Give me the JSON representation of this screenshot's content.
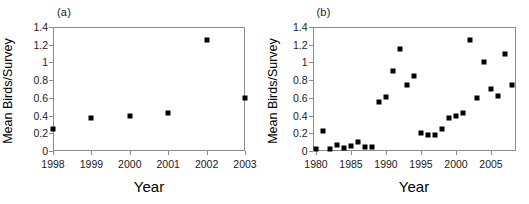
{
  "figure": {
    "panels": [
      {
        "letter": "(a)",
        "chart_data": {
          "type": "scatter",
          "title": "(a)",
          "xlabel": "Year",
          "ylabel": "Mean Birds/Survey",
          "xlim": [
            1998,
            2003
          ],
          "ylim": [
            0,
            1.4
          ],
          "xticks": [
            1998,
            1999,
            2000,
            2001,
            2002,
            2003
          ],
          "xtick_labels": [
            "1998",
            "1999",
            "2000",
            "2001",
            "2002",
            "2003"
          ],
          "yticks": [
            0,
            0.2,
            0.4,
            0.6,
            0.8,
            1,
            1.2,
            1.4
          ],
          "ytick_labels": [
            "0",
            "0.2",
            "0.4",
            "0.6",
            "0.8",
            "1",
            "1.2",
            "1.4"
          ],
          "grid": false,
          "legend": null,
          "marker": "filled-square",
          "marker_color": "#000000",
          "x": [
            1998,
            1999,
            2000,
            2001,
            2002,
            2003
          ],
          "y": [
            0.25,
            0.37,
            0.4,
            0.43,
            1.25,
            0.6
          ]
        }
      },
      {
        "letter": "(b)",
        "chart_data": {
          "type": "scatter",
          "title": "(b)",
          "xlabel": "Year",
          "ylabel": "Mean Birds/Survey",
          "xlim": [
            1979.5,
            2008.5
          ],
          "ylim": [
            0,
            1.4
          ],
          "xticks": [
            1980,
            1985,
            1990,
            1995,
            2000,
            2005
          ],
          "xtick_labels": [
            "1980",
            "1985",
            "1990",
            "1995",
            "2000",
            "2005"
          ],
          "yticks": [
            0,
            0.2,
            0.4,
            0.6,
            0.8,
            1,
            1.2,
            1.4
          ],
          "ytick_labels": [
            "0",
            "0.2",
            "0.4",
            "0.6",
            "0.8",
            "1",
            "1.2",
            "1.4"
          ],
          "grid": false,
          "legend": null,
          "marker": "filled-square",
          "marker_color": "#000000",
          "x": [
            1980,
            1981,
            1982,
            1983,
            1984,
            1985,
            1986,
            1987,
            1988,
            1989,
            1990,
            1991,
            1992,
            1993,
            1994,
            1995,
            1996,
            1997,
            1998,
            1999,
            2000,
            2001,
            2002,
            2003,
            2004,
            2005,
            2006,
            2007,
            2008
          ],
          "y": [
            0.02,
            0.23,
            0.02,
            0.07,
            0.03,
            0.06,
            0.1,
            0.05,
            0.05,
            0.55,
            0.61,
            0.9,
            1.15,
            0.75,
            0.85,
            0.2,
            0.18,
            0.18,
            0.25,
            0.37,
            0.4,
            0.43,
            1.25,
            0.6,
            1.0,
            0.7,
            0.62,
            1.1,
            0.75
          ]
        }
      }
    ],
    "axis_color": "#8c8c8c",
    "background": "#ffffff"
  }
}
